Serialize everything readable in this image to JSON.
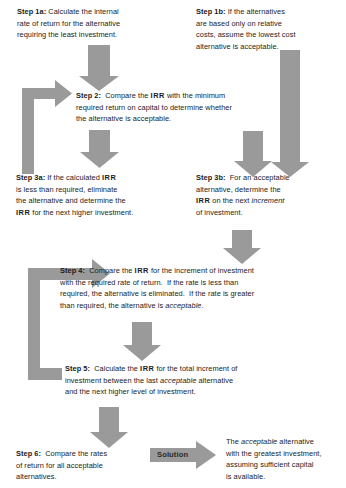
{
  "diagram": {
    "type": "flowchart",
    "arrow_color": "#9a9a9a",
    "text_color": "#1b1b1b",
    "background": "#ffffff"
  },
  "steps": {
    "step1a": {
      "label": "Step 1a:",
      "body": " Calculate the internal\nrate of return for the alternative\nrequiring the least investment."
    },
    "step1b": {
      "label": "Step 1b:",
      "body": " If the alternatives\nare based only on relative\ncosts, assume the lowest cost\nalternative is acceptable."
    },
    "step2": {
      "label": "Step 2:",
      "part1": "  Compare the ",
      "irr1": "IRR",
      "part2": " with the minimum\nrequired return on capital to determine whether\nthe alternative is acceptable."
    },
    "step3a": {
      "label": "Step 3a:",
      "part1": " If the calculated ",
      "irr1": "IRR",
      "part2": "\nis less than required, eliminate\nthe alternative and determine the\n",
      "irr2": "IRR",
      "part3": " for the next higher investment."
    },
    "step3b": {
      "label": "Step 3b:",
      "part1": "  For an acceptable\nalternative, determine the\n",
      "irr1": "IRR",
      "part2": " on the next ",
      "ital1": "increment",
      "part3": "\nof investment."
    },
    "step4": {
      "label": "Step 4:",
      "part1": "  Compare the ",
      "irr1": "IRR",
      "part2": " for the increment of investment\nwith the required rate of return.  If the rate is less than\nrequired, the alternative is eliminated.  If the rate is greater\nthan required, the alternative is ",
      "ital1": "acceptable",
      "part3": "."
    },
    "step5": {
      "label": "Step 5:",
      "part1": "  Calculate the ",
      "irr1": "IRR",
      "part2": " for the total increment of\ninvestment between the last ",
      "ital1": "acceptable",
      "part3": " alternative\nand the next higher level of investment."
    },
    "step6": {
      "label": "Step 6:",
      "body": "  Compare the rates\nof return for all acceptable\nalternatives."
    },
    "solution_label": "Solution",
    "solution_text": {
      "part1": "The ",
      "ital1": "acceptable",
      "part2": " alternative\nwith the greatest investment,\nassuming sufficient capital\nis available."
    }
  }
}
